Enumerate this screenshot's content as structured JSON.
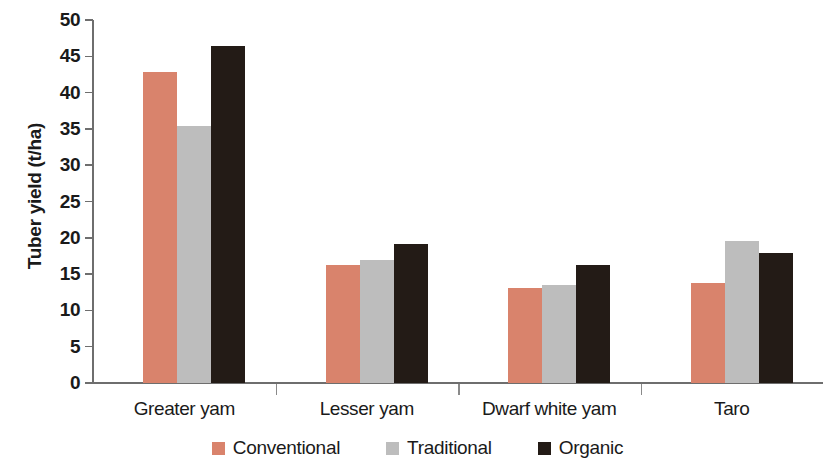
{
  "chart_data": {
    "type": "bar",
    "title": "",
    "xlabel": "",
    "ylabel": "Tuber yield (t/ha)",
    "ylim": [
      0,
      50
    ],
    "ytick_step": 5,
    "yticks": [
      0,
      5,
      10,
      15,
      20,
      25,
      30,
      35,
      40,
      45,
      50
    ],
    "ytick_labels": [
      "0",
      "5",
      "10",
      "15",
      "20",
      "25",
      "30",
      "35",
      "40",
      "45",
      "50"
    ],
    "grid": false,
    "legend_position": "bottom-center",
    "categories": [
      "Greater yam",
      "Lesser yam",
      "Dwarf white yam",
      "Taro"
    ],
    "series": [
      {
        "name": "Conventional",
        "color": "#d9836c",
        "values": [
          42.8,
          16.3,
          13.1,
          13.8
        ]
      },
      {
        "name": "Traditional",
        "color": "#bdbdbd",
        "values": [
          35.4,
          17.0,
          13.5,
          19.6
        ]
      },
      {
        "name": "Organic",
        "color": "#231b16",
        "values": [
          46.4,
          19.1,
          16.3,
          17.9
        ]
      }
    ]
  },
  "axis": {
    "y_title": "Tuber yield (t/ha)"
  },
  "legend": {
    "items": [
      {
        "label": "Conventional",
        "key": "conventional"
      },
      {
        "label": "Traditional",
        "key": "traditional"
      },
      {
        "label": "Organic",
        "key": "organic"
      }
    ]
  }
}
